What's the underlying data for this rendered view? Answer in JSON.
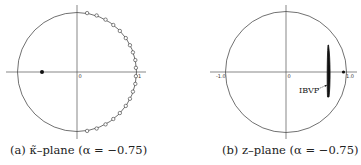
{
  "figure": {
    "panels": [
      {
        "id": "a",
        "caption": "(a) κ̃–plane  (α = −0.75)",
        "tick_labels": {
          "origin": "0",
          "one": "1"
        }
      },
      {
        "id": "b",
        "caption": "(b) z–plane (α = −0.75)",
        "tick_labels": {
          "minus_one": "-1.0",
          "origin": "0",
          "one": "1.0"
        },
        "annotation": "IBVP"
      }
    ]
  },
  "chart_data": [
    {
      "type": "scatter",
      "title": "(a) κ̃–plane (α = −0.75)",
      "xlabel": "",
      "ylabel": "",
      "xlim": [
        -1.1,
        1.1
      ],
      "ylim": [
        -1.1,
        1.1
      ],
      "unit_circle": true,
      "tick_labels": [
        "0",
        "1"
      ],
      "series": [
        {
          "name": "open-circle points on unit circle (right half)",
          "marker": "open",
          "points": [
            [
              0.17,
              0.99
            ],
            [
              0.33,
              0.95
            ],
            [
              0.48,
              0.88
            ],
            [
              0.61,
              0.79
            ],
            [
              0.72,
              0.69
            ],
            [
              0.82,
              0.57
            ],
            [
              0.89,
              0.45
            ],
            [
              0.94,
              0.33
            ],
            [
              0.98,
              0.2
            ],
            [
              0.99,
              0.07
            ],
            [
              0.99,
              -0.07
            ],
            [
              0.98,
              -0.2
            ],
            [
              0.94,
              -0.33
            ],
            [
              0.89,
              -0.45
            ],
            [
              0.82,
              -0.57
            ],
            [
              0.72,
              -0.69
            ],
            [
              0.61,
              -0.79
            ],
            [
              0.48,
              -0.88
            ],
            [
              0.33,
              -0.95
            ],
            [
              0.17,
              -0.99
            ]
          ]
        },
        {
          "name": "filled point",
          "marker": "filled",
          "points": [
            [
              -0.59,
              0
            ]
          ]
        }
      ]
    },
    {
      "type": "scatter",
      "title": "(b) z–plane (α = −0.75)",
      "xlabel": "",
      "ylabel": "",
      "xlim": [
        -1.1,
        1.1
      ],
      "ylim": [
        -1.1,
        1.1
      ],
      "unit_circle": true,
      "tick_labels": [
        "-1.0",
        "0",
        "1.0"
      ],
      "series": [
        {
          "name": "IBVP eigenvalue cluster",
          "marker": "dense-band",
          "x_range": [
            0.68,
            0.72
          ],
          "y_range": [
            -0.42,
            0.45
          ]
        },
        {
          "name": "filled point",
          "marker": "filled",
          "points": [
            [
              0.94,
              0
            ]
          ]
        }
      ],
      "annotations": [
        {
          "text": "IBVP",
          "x": 0.2,
          "y": -0.3,
          "arrow_to": [
            0.69,
            -0.22
          ]
        }
      ]
    }
  ]
}
